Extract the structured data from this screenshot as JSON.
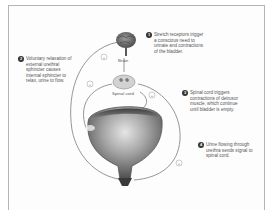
{
  "diagram": {
    "labels": {
      "brain": "Brain",
      "spinal_cord": "Spinal cord"
    },
    "steps": [
      {
        "number": "1",
        "text": "Stretch receptors trigger a conscious need to urinate and contractions of the bladder."
      },
      {
        "number": "2",
        "text": "Voluntary relaxation of external urethral sphincter causes internal sphincter to relax, urine to flow."
      },
      {
        "number": "3",
        "text": "Spinal cord triggers contractions of detrusor muscle, which continue until bladder is empty."
      },
      {
        "number": "4",
        "text": "Urine flowing through urethra sends signal to spinal cord."
      }
    ],
    "signs": {
      "plus": "+"
    },
    "colors": {
      "bladder_dark": "#3a3a3a",
      "bladder_mid": "#8a8a8a",
      "bladder_light": "#d8d8d8",
      "brain": "#6a6a6a",
      "pathway": "#888888",
      "frame": "#b5b5b5"
    }
  }
}
